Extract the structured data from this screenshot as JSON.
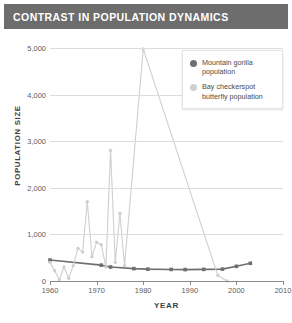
{
  "title": "CONTRAST IN POPULATION DYNAMICS",
  "legend": {
    "items": [
      {
        "label": "Mountain gorilla population",
        "color": "#6f6f6f",
        "marker": "circle-marker"
      },
      {
        "label": "Bay checkerspot butterfly population",
        "color": "#cfcfcf",
        "marker": "circle-marker"
      }
    ]
  },
  "axes": {
    "y_title": "POPULATION  SIZE",
    "x_title": "YEAR",
    "y_ticks": [
      "0",
      "1,000",
      "2,000",
      "3,000",
      "4,000",
      "5,000"
    ],
    "x_ticks": [
      "1960",
      "1970",
      "1980",
      "1990",
      "2000",
      "2010"
    ]
  },
  "chart_data": {
    "type": "line",
    "title": "CONTRAST IN POPULATION DYNAMICS",
    "xlabel": "YEAR",
    "ylabel": "POPULATION  SIZE",
    "xlim": [
      1960,
      2010
    ],
    "ylim": [
      0,
      5000
    ],
    "y_ticks": [
      0,
      1000,
      2000,
      3000,
      4000,
      5000
    ],
    "x_ticks": [
      1960,
      1970,
      1980,
      1990,
      2000,
      2010
    ],
    "grid": "horizontal",
    "legend_position": "top-right",
    "series": [
      {
        "name": "Mountain gorilla population",
        "color": "#6f6f6f",
        "marker": "square",
        "points": [
          {
            "x": 1960,
            "y": 450
          },
          {
            "x": 1971,
            "y": 340
          },
          {
            "x": 1973,
            "y": 300
          },
          {
            "x": 1978,
            "y": 265
          },
          {
            "x": 1981,
            "y": 254
          },
          {
            "x": 1986,
            "y": 248
          },
          {
            "x": 1989,
            "y": 245
          },
          {
            "x": 1993,
            "y": 250
          },
          {
            "x": 1997,
            "y": 255
          },
          {
            "x": 2000,
            "y": 315
          },
          {
            "x": 2003,
            "y": 380
          }
        ]
      },
      {
        "name": "Bay checkerspot butterfly population",
        "color": "#cfcfcf",
        "marker": "circle",
        "points": [
          {
            "x": 1960,
            "y": 400
          },
          {
            "x": 1961,
            "y": 220
          },
          {
            "x": 1962,
            "y": 30
          },
          {
            "x": 1963,
            "y": 300
          },
          {
            "x": 1964,
            "y": 60
          },
          {
            "x": 1965,
            "y": 330
          },
          {
            "x": 1966,
            "y": 700
          },
          {
            "x": 1967,
            "y": 620
          },
          {
            "x": 1968,
            "y": 1700
          },
          {
            "x": 1969,
            "y": 520
          },
          {
            "x": 1970,
            "y": 830
          },
          {
            "x": 1971,
            "y": 780
          },
          {
            "x": 1972,
            "y": 300
          },
          {
            "x": 1973,
            "y": 2800
          },
          {
            "x": 1974,
            "y": 400
          },
          {
            "x": 1975,
            "y": 1450
          },
          {
            "x": 1976,
            "y": 330
          },
          {
            "x": 1980,
            "y": 4980
          },
          {
            "x": 1996,
            "y": 120
          },
          {
            "x": 1998,
            "y": 0
          }
        ]
      }
    ]
  }
}
